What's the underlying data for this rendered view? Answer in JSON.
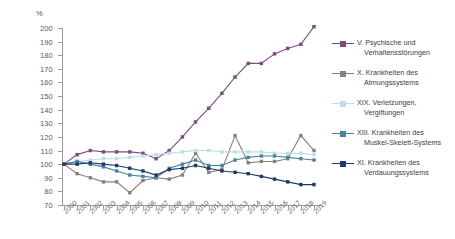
{
  "chart_data": {
    "type": "line",
    "title": "",
    "subtitle": "",
    "xlabel": "",
    "ylabel": "%",
    "unit_label": "%",
    "grid": false,
    "legend_position": "right",
    "ylim": [
      70,
      200
    ],
    "ytick_step": 10,
    "yticks": [
      70,
      80,
      90,
      100,
      110,
      120,
      130,
      140,
      150,
      160,
      170,
      180,
      190,
      200
    ],
    "ytick_labels": [
      "70",
      "80",
      "90",
      "100",
      "110",
      "120",
      "130",
      "140",
      "150",
      "160",
      "170",
      "180",
      "190",
      "200"
    ],
    "categories": [
      "2000",
      "2001",
      "2002",
      "2003",
      "2004",
      "2005",
      "2006",
      "2007",
      "2008",
      "2009",
      "2010",
      "2011",
      "2012",
      "2013",
      "2014",
      "2015",
      "2016",
      "2017",
      "2018",
      "2019"
    ],
    "series": [
      {
        "name": "V. Psychische und Verhaltensstörungen",
        "label_line1": "V. Psychische und",
        "label_line2": "Verhaltensstörungen",
        "color": "#7B4A7E",
        "values": [
          100,
          107,
          110,
          109,
          109,
          109,
          108,
          104,
          110,
          120,
          131,
          141,
          152,
          164,
          174,
          174,
          181,
          185,
          188,
          201
        ]
      },
      {
        "name": "X. Krankheiten des Atmungssystems",
        "label_line1": "X. Krankheiten des",
        "label_line2": "Atmungssystems",
        "color": "#8C7F78",
        "values": [
          100,
          93,
          90,
          87,
          87,
          79,
          88,
          90,
          89,
          92,
          108,
          94,
          96,
          121,
          101,
          102,
          102,
          104,
          121,
          110
        ]
      },
      {
        "name": "XIX. Verletzungen, Vergiftungen",
        "label_line1": "XIX. Verletzungen,",
        "label_line2": "Vergiftungen",
        "color": "#BFDCE8",
        "values": [
          100,
          102,
          103,
          104,
          104,
          105,
          106,
          107,
          108,
          109,
          110,
          110,
          109,
          109,
          109,
          109,
          108,
          108,
          108,
          107
        ]
      },
      {
        "name": "XIII. Krankheiten des Muskel-Skelett-Systems",
        "label_line1": "XIII. Krankheiten des",
        "label_line2": "Muskel-Skelett-Systems",
        "color": "#45869E",
        "values": [
          100,
          102,
          100,
          98,
          95,
          92,
          91,
          90,
          97,
          100,
          103,
          99,
          99,
          103,
          105,
          106,
          106,
          105,
          104,
          103
        ]
      },
      {
        "name": "XI. Krankheiten des Verdauungssystems",
        "label_line1": "XI. Krankheiten des",
        "label_line2": "Verdauungssystems",
        "color": "#1F3864",
        "values": [
          100,
          100,
          101,
          100,
          99,
          97,
          95,
          92,
          96,
          97,
          99,
          97,
          95,
          94,
          93,
          91,
          89,
          87,
          85,
          85
        ]
      }
    ]
  }
}
